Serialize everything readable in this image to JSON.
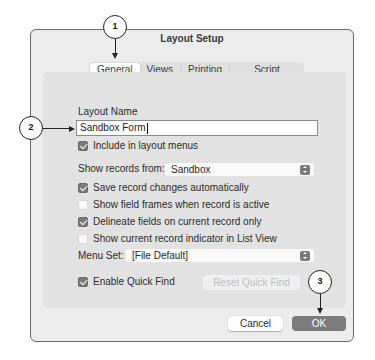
{
  "dialog": {
    "title": "Layout Setup",
    "tabs": [
      {
        "label": "General",
        "selected": true
      },
      {
        "label": "Views",
        "selected": false
      },
      {
        "label": "Printing",
        "selected": false
      },
      {
        "label": "Script Triggers",
        "selected": false
      }
    ],
    "layout_name_label": "Layout Name",
    "layout_name_value": "Sandbox Form",
    "include_in_menus": {
      "label": "Include in layout menus",
      "checked": true
    },
    "show_records_from": {
      "label": "Show records from:",
      "value": "Sandbox"
    },
    "options": [
      {
        "label": "Save record changes automatically",
        "checked": true
      },
      {
        "label": "Show field frames when record is active",
        "checked": false
      },
      {
        "label": "Delineate fields on current record only",
        "checked": true
      },
      {
        "label": "Show current record indicator in List View",
        "checked": false
      }
    ],
    "menu_set": {
      "label": "Menu Set:",
      "value": "[File Default]"
    },
    "enable_quick_find": {
      "label": "Enable Quick Find",
      "checked": true
    },
    "reset_quick_find_label": "Reset Quick Find",
    "cancel_label": "Cancel",
    "ok_label": "OK"
  },
  "callouts": [
    {
      "number": "1",
      "target": "General tab"
    },
    {
      "number": "2",
      "target": "Layout Name field"
    },
    {
      "number": "3",
      "target": "OK button"
    }
  ],
  "colors": {
    "window_bg": "#ececec",
    "panel_bg": "#e2e2e2",
    "checkbox_on": "#7a7a7a",
    "default_button": "#7c7c7c"
  }
}
